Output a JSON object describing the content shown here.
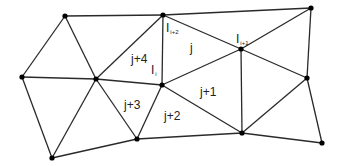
{
  "diagram": {
    "colors": {
      "edge": "#2a2a2a",
      "node": "#000000",
      "text": "#222222"
    },
    "nodes": [
      {
        "id": "n0",
        "x": 65,
        "y": 16
      },
      {
        "id": "I_i+2",
        "x": 163,
        "y": 15
      },
      {
        "id": "n2",
        "x": 311,
        "y": 8
      },
      {
        "id": "n3",
        "x": 22,
        "y": 77
      },
      {
        "id": "n4",
        "x": 96,
        "y": 79
      },
      {
        "id": "I_i",
        "x": 162,
        "y": 85
      },
      {
        "id": "I_i+1",
        "x": 241,
        "y": 49
      },
      {
        "id": "n7",
        "x": 307,
        "y": 78
      },
      {
        "id": "n8",
        "x": 52,
        "y": 158
      },
      {
        "id": "n9",
        "x": 137,
        "y": 139
      },
      {
        "id": "n10",
        "x": 242,
        "y": 133
      },
      {
        "id": "n11",
        "x": 322,
        "y": 143
      }
    ],
    "edges": [
      [
        0,
        1
      ],
      [
        1,
        2
      ],
      [
        3,
        0
      ],
      [
        0,
        4
      ],
      [
        3,
        4
      ],
      [
        4,
        1
      ],
      [
        1,
        5
      ],
      [
        1,
        6
      ],
      [
        6,
        7
      ],
      [
        2,
        6
      ],
      [
        2,
        7
      ],
      [
        4,
        5
      ],
      [
        5,
        6
      ],
      [
        3,
        8
      ],
      [
        8,
        4
      ],
      [
        8,
        9
      ],
      [
        4,
        9
      ],
      [
        9,
        5
      ],
      [
        5,
        10
      ],
      [
        6,
        10
      ],
      [
        7,
        10
      ],
      [
        9,
        10
      ],
      [
        10,
        11
      ],
      [
        7,
        11
      ]
    ],
    "node_labels": [
      {
        "text": "I",
        "sub": "i+2",
        "x": 166,
        "y": 32
      },
      {
        "text": "I",
        "sub": "i",
        "x": 151,
        "y": 74
      },
      {
        "text": "I",
        "sub": "i+1",
        "x": 236,
        "y": 43
      }
    ],
    "element_labels": [
      {
        "text": "j",
        "x": 190,
        "y": 52
      },
      {
        "text": "j+4",
        "x": 131,
        "y": 63
      },
      {
        "text": "j+1",
        "x": 200,
        "y": 96
      },
      {
        "text": "j+3",
        "x": 124,
        "y": 109
      },
      {
        "text": "j+2",
        "x": 164,
        "y": 120
      }
    ]
  }
}
